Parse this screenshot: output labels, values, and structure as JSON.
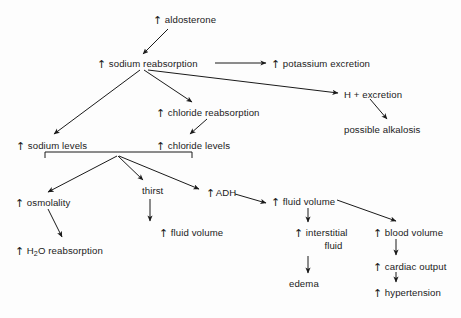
{
  "diagram": {
    "type": "flowchart",
    "background_color": "#fdfdfd",
    "text_color": "#1b1b1b",
    "line_color": "#1a1a1a",
    "up_arrow_glyph": "↑",
    "down_arrow_glyph": "↓",
    "nodes": [
      {
        "id": "aldosterone",
        "glyph": "↑",
        "label": "aldosterone",
        "x": 153,
        "y": 14
      },
      {
        "id": "sodium-reabsorption",
        "glyph": "↑",
        "label": "sodium reabsorption",
        "x": 97,
        "y": 58
      },
      {
        "id": "potassium-excretion",
        "glyph": "↑",
        "label": "potassium excretion",
        "x": 271,
        "y": 58
      },
      {
        "id": "h-excretion",
        "glyph": "",
        "label": "H + excretion",
        "x": 344,
        "y": 89
      },
      {
        "id": "possible-alkalosis",
        "glyph": "",
        "label": "possible alkalosis",
        "x": 344,
        "y": 124
      },
      {
        "id": "chloride-reabsorption",
        "glyph": "↑",
        "label": "chloride reabsorption",
        "x": 156,
        "y": 107
      },
      {
        "id": "sodium-levels",
        "glyph": "↑",
        "label": "sodium levels",
        "x": 16,
        "y": 140
      },
      {
        "id": "chloride-levels",
        "glyph": "↑",
        "label": "chloride levels",
        "x": 156,
        "y": 140
      },
      {
        "id": "osmolality",
        "glyph": "↑",
        "label": "osmolality",
        "x": 15,
        "y": 197
      },
      {
        "id": "h2o-reabsorption",
        "glyph": "↑",
        "label": "H₂O reabsorption",
        "x": 15,
        "y": 245
      },
      {
        "id": "thirst",
        "glyph": "",
        "label": "thirst",
        "x": 142,
        "y": 185
      },
      {
        "id": "fluid-volume-thirst",
        "glyph": "↑",
        "label": "fluid volume",
        "x": 159,
        "y": 227
      },
      {
        "id": "adh",
        "glyph": "↑",
        "label": "ADH",
        "x": 206,
        "y": 187
      },
      {
        "id": "fluid-volume-adh",
        "glyph": "↑",
        "label": "fluid volume",
        "x": 271,
        "y": 196
      },
      {
        "id": "interstitial-fluid",
        "glyph": "↑",
        "label": "interstitial",
        "label2": "fluid",
        "x": 294,
        "y": 227
      },
      {
        "id": "edema",
        "glyph": "",
        "label": "edema",
        "x": 289,
        "y": 278
      },
      {
        "id": "blood-volume",
        "glyph": "↑",
        "label": "blood volume",
        "x": 373,
        "y": 227
      },
      {
        "id": "cardiac-output",
        "glyph": "↑",
        "label": "cardiac output",
        "x": 373,
        "y": 261
      },
      {
        "id": "hypertension",
        "glyph": "↑",
        "label": "hypertension",
        "x": 373,
        "y": 287
      }
    ],
    "edges": [
      {
        "from": "aldosterone",
        "to": "sodium-reabsorption"
      },
      {
        "from": "sodium-reabsorption",
        "to": "potassium-excretion"
      },
      {
        "from": "sodium-reabsorption",
        "to": "h-excretion"
      },
      {
        "from": "sodium-reabsorption",
        "to": "sodium-levels"
      },
      {
        "from": "sodium-reabsorption",
        "to": "chloride-reabsorption"
      },
      {
        "from": "h-excretion",
        "to": "possible-alkalosis"
      },
      {
        "from": "chloride-reabsorption",
        "to": "chloride-levels"
      },
      {
        "from": "levels-bracket",
        "to": "osmolality"
      },
      {
        "from": "levels-bracket",
        "to": "thirst"
      },
      {
        "from": "levels-bracket",
        "to": "adh"
      },
      {
        "from": "osmolality",
        "to": "h2o-reabsorption"
      },
      {
        "from": "thirst",
        "to": "fluid-volume-thirst"
      },
      {
        "from": "adh",
        "to": "fluid-volume-adh"
      },
      {
        "from": "fluid-volume-adh",
        "to": "interstitial-fluid"
      },
      {
        "from": "fluid-volume-adh",
        "to": "blood-volume"
      },
      {
        "from": "interstitial-fluid",
        "to": "edema"
      },
      {
        "from": "blood-volume",
        "to": "cardiac-output"
      },
      {
        "from": "cardiac-output",
        "to": "hypertension"
      }
    ]
  }
}
